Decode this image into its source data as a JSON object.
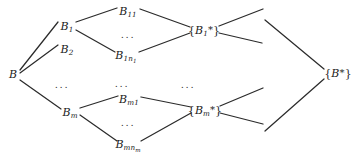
{
  "figure": {
    "type": "tree-diagram",
    "background_color": "#ffffff",
    "line_color": "#2b2b2b",
    "text_color": "#1a1a1a",
    "width": 359,
    "height": 155
  },
  "nodes": {
    "root": {
      "label": "B",
      "x": 13,
      "y": 74
    },
    "b1": {
      "label": "B1",
      "x": 67,
      "y": 26
    },
    "b2": {
      "label": "B2",
      "x": 67,
      "y": 49
    },
    "bm": {
      "label": "Bm",
      "x": 70,
      "y": 112
    },
    "b11": {
      "label": "B11",
      "x": 128,
      "y": 11
    },
    "b1n1": {
      "label": "B1n1",
      "x": 126,
      "y": 55
    },
    "bm1": {
      "label": "Bm1",
      "x": 129,
      "y": 99
    },
    "bmnm": {
      "label": "Bmnm",
      "x": 128,
      "y": 144
    },
    "b1star": {
      "label": "{B1*}",
      "x": 204,
      "y": 30
    },
    "bmstar": {
      "label": "{Bm*}",
      "x": 205,
      "y": 110
    },
    "bstar": {
      "label": "{B*}",
      "x": 338,
      "y": 73
    }
  },
  "node_text": {
    "root": "B",
    "b1_base": "B",
    "b1_sub": "1",
    "b2_base": "B",
    "b2_sub": "2",
    "bm_base": "B",
    "bm_sub": "m",
    "b11_base": "B",
    "b11_sub": "11",
    "b1n1_base": "B",
    "b1n1_sub": "1n",
    "b1n1_subsub": "1",
    "bm1_base": "B",
    "bm1_sub": "m1",
    "bmnm_base": "B",
    "bmnm_sub": "mn",
    "bmnm_subsub": "m",
    "b1star_open": "{",
    "b1star_base": "B",
    "b1star_sub": "1",
    "b1star_star": "*",
    "b1star_close": "}",
    "bmstar_open": "{",
    "bmstar_base": "B",
    "bmstar_sub": "m",
    "bmstar_star": "*",
    "bmstar_close": "}",
    "bstar_open": "{",
    "bstar_base": "B",
    "bstar_star": "*",
    "bstar_close": "}"
  },
  "ellipses": [
    {
      "name": "ellipsis-col1",
      "text": "...",
      "x": 62,
      "y": 84
    },
    {
      "name": "ellipsis-col2-upper",
      "text": "...",
      "x": 128,
      "y": 34
    },
    {
      "name": "ellipsis-col2-middle",
      "text": "...",
      "x": 122,
      "y": 83
    },
    {
      "name": "ellipsis-col2-lower",
      "text": "...",
      "x": 128,
      "y": 122
    },
    {
      "name": "ellipsis-col3",
      "text": "...",
      "x": 188,
      "y": 84
    }
  ],
  "edges": [
    {
      "name": "edge-b-to-b1",
      "x1": 20,
      "y1": 70,
      "x2": 58,
      "y2": 22
    },
    {
      "name": "edge-b-to-b2",
      "x1": 20,
      "y1": 73,
      "x2": 58,
      "y2": 45
    },
    {
      "name": "edge-b-to-bm",
      "x1": 20,
      "y1": 80,
      "x2": 61,
      "y2": 109
    },
    {
      "name": "edge-b1-to-b11",
      "x1": 76,
      "y1": 22,
      "x2": 117,
      "y2": 8
    },
    {
      "name": "edge-b1-to-b1n1",
      "x1": 76,
      "y1": 30,
      "x2": 115,
      "y2": 52
    },
    {
      "name": "edge-b11-to-b1star",
      "x1": 140,
      "y1": 9,
      "x2": 190,
      "y2": 27
    },
    {
      "name": "edge-b1n1-to-b1star",
      "x1": 139,
      "y1": 52,
      "x2": 190,
      "y2": 33
    },
    {
      "name": "edge-bm-to-bm1",
      "x1": 80,
      "y1": 108,
      "x2": 118,
      "y2": 96
    },
    {
      "name": "edge-bm-to-bmnm",
      "x1": 80,
      "y1": 115,
      "x2": 117,
      "y2": 141
    },
    {
      "name": "edge-bm1-to-bmstar",
      "x1": 141,
      "y1": 97,
      "x2": 191,
      "y2": 107
    },
    {
      "name": "edge-bmnm-to-bmstar",
      "x1": 141,
      "y1": 141,
      "x2": 191,
      "y2": 113
    },
    {
      "name": "edge-b1star-upper-stub",
      "x1": 219,
      "y1": 26,
      "x2": 263,
      "y2": 9
    },
    {
      "name": "edge-b1star-lower-stub",
      "x1": 219,
      "y1": 33,
      "x2": 262,
      "y2": 43
    },
    {
      "name": "edge-bmstar-upper-stub",
      "x1": 220,
      "y1": 106,
      "x2": 263,
      "y2": 88
    },
    {
      "name": "edge-bmstar-lower-stub",
      "x1": 220,
      "y1": 113,
      "x2": 263,
      "y2": 124
    },
    {
      "name": "edge-upper-to-bstar",
      "x1": 265,
      "y1": 20,
      "x2": 324,
      "y2": 69
    },
    {
      "name": "edge-lower-to-bstar",
      "x1": 265,
      "y1": 131,
      "x2": 324,
      "y2": 79
    }
  ]
}
